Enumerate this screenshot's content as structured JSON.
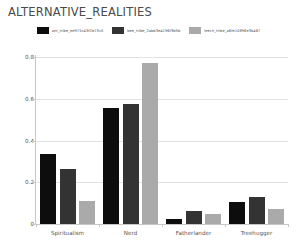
{
  "chart_data": {
    "type": "bar",
    "title": "ALTERNATIVE_REALITIES",
    "xlabel": "",
    "ylabel": "",
    "ylim": [
      0,
      0.8
    ],
    "yticks": [
      "0",
      "0.2",
      "0.4",
      "0.6",
      "0.8"
    ],
    "ytick_values": [
      0,
      0.2,
      0.4,
      0.6,
      0.8
    ],
    "grid": true,
    "legend_position": "top-center",
    "categories": [
      "Spiritualism",
      "Nerd",
      "Fatherlander",
      "Treehugger"
    ],
    "series": [
      {
        "name": "ant_tribe_ee975c43f2b73c0",
        "color": "#0d0d0d",
        "values": [
          0.335,
          0.555,
          0.022,
          0.105
        ]
      },
      {
        "name": "bee_tribe_2abb3e4196f3b9b",
        "color": "#333333",
        "values": [
          0.265,
          0.575,
          0.06,
          0.13
        ]
      },
      {
        "name": "leech_tribe_a6fe10896e3b467",
        "color": "#aaaaaa",
        "values": [
          0.11,
          0.77,
          0.05,
          0.07
        ]
      }
    ]
  }
}
